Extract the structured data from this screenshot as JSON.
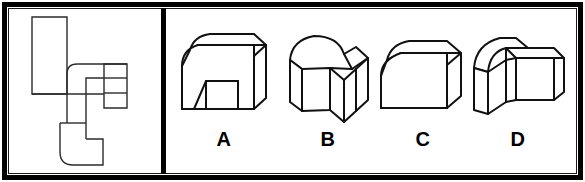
{
  "figure": {
    "kind": "spatial-reasoning-multiple-choice",
    "frame_color": "#000000",
    "background_color": "#ffffff",
    "line_color": "#111111",
    "panel_count": 2
  },
  "stem_panel": {
    "name": "flat-pattern-panel",
    "description": "unfolded flat pattern outline drawing",
    "shape_name": "flat-pattern",
    "has_rounded_corners": true
  },
  "options_panel": {
    "name": "answer-options-panel",
    "options": [
      {
        "label": "A",
        "shape_name": "arch-block-with-rectangular-notch",
        "rounded_corner": true
      },
      {
        "label": "B",
        "shape_name": "l-shaped-elbow-block-rounded-outer-corner",
        "rounded_corner": true
      },
      {
        "label": "C",
        "shape_name": "block-with-single-rounded-corner",
        "rounded_corner": true
      },
      {
        "label": "D",
        "shape_name": "l-shaped-elbow-block-rotated",
        "rounded_corner": true
      }
    ]
  }
}
